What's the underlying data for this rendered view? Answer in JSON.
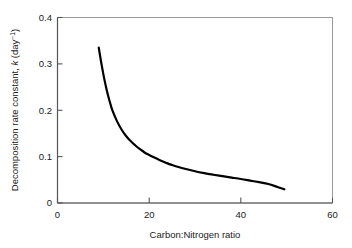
{
  "chart_data": {
    "type": "line",
    "title": "",
    "subtitle": "",
    "xlabel": "Carbon:Nitrogen ratio",
    "ylabel_full": "Decomposition rate constant, k (day-1)",
    "ylabel_prefix": "Decomposition rate constant, ",
    "ylabel_variable": "k",
    "ylabel_units_open": " (day",
    "ylabel_units_exp": "−1",
    "ylabel_units_close": ")",
    "xlim": [
      0,
      60
    ],
    "ylim": [
      0,
      0.4
    ],
    "xticks": [
      0,
      20,
      40,
      60
    ],
    "xtick_labels": [
      "0",
      "20",
      "40",
      "60"
    ],
    "yticks": [
      0,
      0.1,
      0.2,
      0.3,
      0.4
    ],
    "ytick_labels": [
      "0",
      "0.1",
      "0.2",
      "0.3",
      "0.4"
    ],
    "grid": false,
    "legend": false,
    "legend_position": "none",
    "tick_direction": "in",
    "series": [
      {
        "name": "decomposition rate constant",
        "color": "#000000",
        "line_width": 2.2,
        "x": [
          9.0,
          9.5,
          10.0,
          10.5,
          11.0,
          11.5,
          12.0,
          13.0,
          14.0,
          15.0,
          16.0,
          17.0,
          18.0,
          19.0,
          20.0,
          21.0,
          22.0,
          23.0,
          24.0,
          25.0,
          26.0,
          28.0,
          30.0,
          32.0,
          34.0,
          36.0,
          38.0,
          40.0,
          42.0,
          44.0,
          46.0,
          48.0,
          49.5
        ],
        "y": [
          0.335,
          0.305,
          0.278,
          0.254,
          0.233,
          0.215,
          0.199,
          0.176,
          0.158,
          0.144,
          0.133,
          0.124,
          0.116,
          0.109,
          0.1035,
          0.0985,
          0.094,
          0.0895,
          0.0855,
          0.082,
          0.0788,
          0.0732,
          0.0685,
          0.0645,
          0.061,
          0.0578,
          0.0548,
          0.0518,
          0.0484,
          0.0449,
          0.041,
          0.0345,
          0.0295
        ]
      }
    ],
    "annotations": []
  },
  "figure": {
    "frame_color": "#8c8c8c",
    "axis_color": "#4d4d4d",
    "curve_color": "#000000",
    "background": "#ffffff"
  }
}
